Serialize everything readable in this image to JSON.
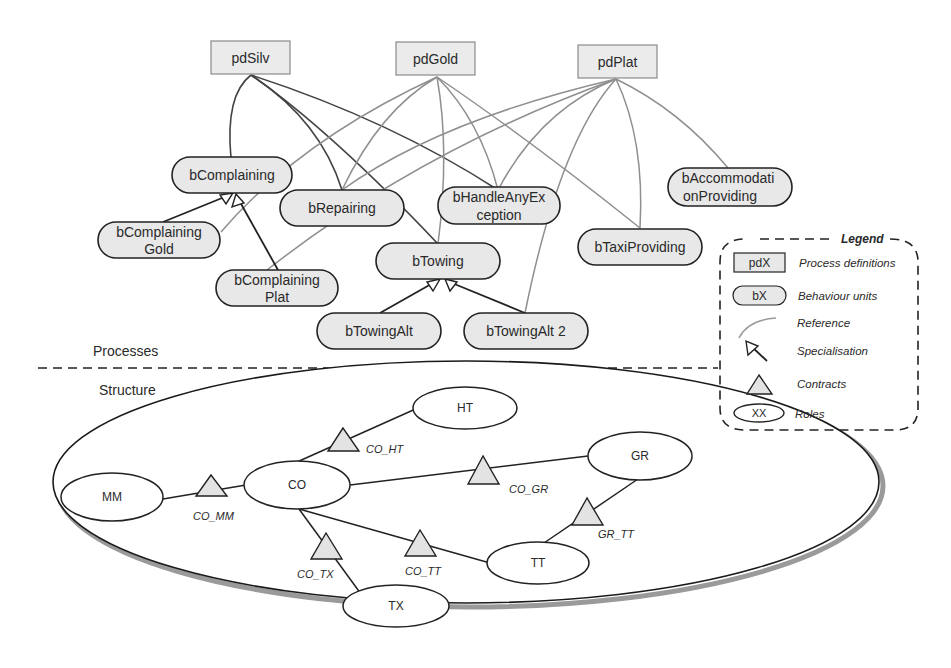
{
  "process_definitions": [
    {
      "id": "pdSilv",
      "label": "pdSilv"
    },
    {
      "id": "pdGold",
      "label": "pdGold"
    },
    {
      "id": "pdPlat",
      "label": "pdPlat"
    }
  ],
  "behaviour_units": [
    {
      "id": "bComplaining",
      "lines": [
        "bComplaining"
      ]
    },
    {
      "id": "bComplainingGold",
      "lines": [
        "bComplaining",
        "Gold"
      ]
    },
    {
      "id": "bComplainingPlat",
      "lines": [
        "bComplaining",
        "Plat"
      ]
    },
    {
      "id": "bRepairing",
      "lines": [
        "bRepairing"
      ]
    },
    {
      "id": "bHandleAnyException",
      "lines": [
        "bHandleAnyEx",
        "ception"
      ]
    },
    {
      "id": "bTowing",
      "lines": [
        "bTowing"
      ]
    },
    {
      "id": "bTowingAlt",
      "lines": [
        "bTowingAlt"
      ]
    },
    {
      "id": "bTowingAlt2",
      "lines": [
        "bTowingAlt  2"
      ]
    },
    {
      "id": "bTaxiProviding",
      "lines": [
        "bTaxiProviding"
      ]
    },
    {
      "id": "bAccommodationProviding",
      "lines": [
        "bAccommodati",
        "onProviding"
      ]
    }
  ],
  "sections": {
    "processes": "Processes",
    "structure": "Structure"
  },
  "roles": [
    {
      "id": "MM",
      "label": "MM"
    },
    {
      "id": "CO",
      "label": "CO"
    },
    {
      "id": "HT",
      "label": "HT"
    },
    {
      "id": "GR",
      "label": "GR"
    },
    {
      "id": "TT",
      "label": "TT"
    },
    {
      "id": "TX",
      "label": "TX"
    }
  ],
  "contracts": [
    {
      "id": "CO_MM",
      "label": "CO_MM",
      "between": [
        "CO",
        "MM"
      ]
    },
    {
      "id": "CO_HT",
      "label": "CO_HT",
      "between": [
        "CO",
        "HT"
      ]
    },
    {
      "id": "CO_GR",
      "label": "CO_GR",
      "between": [
        "CO",
        "GR"
      ]
    },
    {
      "id": "CO_TT",
      "label": "CO_TT",
      "between": [
        "CO",
        "TT"
      ]
    },
    {
      "id": "CO_TX",
      "label": "CO_TX",
      "between": [
        "CO",
        "TX"
      ]
    },
    {
      "id": "GR_TT",
      "label": "GR_TT",
      "between": [
        "GR",
        "TT"
      ]
    }
  ],
  "references": [
    {
      "from": "pdSilv",
      "to": [
        "bComplaining",
        "bRepairing",
        "bTowing",
        "bHandleAnyException"
      ]
    },
    {
      "from": "pdGold",
      "to": [
        "bComplainingGold",
        "bRepairing",
        "bTowing",
        "bHandleAnyException",
        "bTaxiProviding"
      ]
    },
    {
      "from": "pdPlat",
      "to": [
        "bComplainingPlat",
        "bRepairing",
        "bHandleAnyException",
        "bTowingAlt2",
        "bTaxiProviding",
        "bAccommodationProviding"
      ]
    }
  ],
  "specialisations": [
    {
      "child": "bComplainingGold",
      "parent": "bComplaining"
    },
    {
      "child": "bComplainingPlat",
      "parent": "bComplaining"
    },
    {
      "child": "bTowingAlt",
      "parent": "bTowing"
    },
    {
      "child": "bTowingAlt2",
      "parent": "bTowing"
    }
  ],
  "legend": {
    "title": "Legend",
    "items": [
      {
        "symbol": "pdX",
        "label": "Process definitions"
      },
      {
        "symbol": "bX",
        "label": "Behaviour units"
      },
      {
        "symbol": "",
        "label": "Reference"
      },
      {
        "symbol": "",
        "label": "Specialisation"
      },
      {
        "symbol": "",
        "label": "Contracts"
      },
      {
        "symbol": "XX",
        "label": "Roles"
      }
    ]
  }
}
